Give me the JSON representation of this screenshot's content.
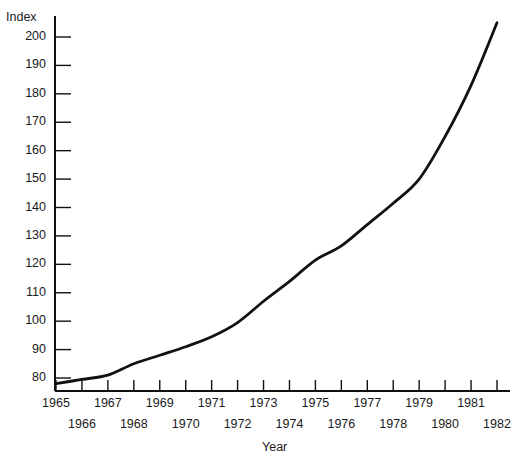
{
  "chart_data": {
    "type": "line",
    "title": "",
    "xlabel": "Year",
    "ylabel": "Index",
    "x": [
      1965,
      1966,
      1967,
      1968,
      1969,
      1970,
      1971,
      1972,
      1973,
      1974,
      1975,
      1976,
      1977,
      1978,
      1979,
      1980,
      1981,
      1982
    ],
    "values": [
      78,
      79.5,
      81,
      85,
      88,
      91,
      94.5,
      99.5,
      107,
      114,
      121.5,
      126.5,
      134,
      141.5,
      150,
      165,
      183,
      205
    ],
    "series": [
      {
        "name": "Index",
        "values": [
          78,
          79.5,
          81,
          85,
          88,
          91,
          94.5,
          99.5,
          107,
          114,
          121.5,
          126.5,
          134,
          141.5,
          150,
          165,
          183,
          205
        ]
      }
    ],
    "xlim": [
      1965,
      1982
    ],
    "ylim": [
      74,
      208
    ],
    "yticks": [
      80,
      90,
      100,
      110,
      120,
      130,
      140,
      150,
      160,
      170,
      180,
      190,
      200
    ],
    "ytick_labels": [
      "80",
      "90",
      "100",
      "110",
      "120",
      "130",
      "140",
      "150",
      "160",
      "170",
      "180",
      "190",
      "200"
    ],
    "xticks": [
      1965,
      1966,
      1967,
      1968,
      1969,
      1970,
      1971,
      1972,
      1973,
      1974,
      1975,
      1976,
      1977,
      1978,
      1979,
      1980,
      1981,
      1982
    ],
    "xtick_labels_upper": [
      "1965",
      "",
      "1967",
      "",
      "1969",
      "",
      "1971",
      "",
      "1973",
      "",
      "1975",
      "",
      "1977",
      "",
      "1979",
      "",
      "1981",
      ""
    ],
    "xtick_labels_lower": [
      "",
      "1966",
      "",
      "1968",
      "",
      "1970",
      "",
      "1972",
      "",
      "1974",
      "",
      "1976",
      "",
      "1978",
      "",
      "1980",
      "",
      "1982"
    ],
    "grid": false,
    "legend": false,
    "line_color": "#111111",
    "axis_color": "#111111",
    "background_color": "#ffffff"
  },
  "labels": {
    "y_axis_title": "Index",
    "x_axis_title": "Year"
  }
}
